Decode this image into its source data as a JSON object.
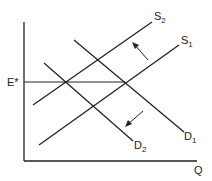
{
  "diagram": {
    "type": "supply-demand",
    "axes": {
      "x_label": "Q",
      "y_label": ""
    },
    "price_marker": {
      "label": "E*",
      "base": "E",
      "sup": "*"
    },
    "curves": [
      {
        "name": "S1",
        "base": "S",
        "sub": "1",
        "x1": 39,
        "y1": 145,
        "x2": 179,
        "y2": 45
      },
      {
        "name": "S2",
        "base": "S",
        "sub": "2",
        "x1": 33,
        "y1": 105,
        "x2": 152,
        "y2": 22
      },
      {
        "name": "D1",
        "base": "D",
        "sub": "1",
        "x1": 74,
        "y1": 40,
        "x2": 184,
        "y2": 132
      },
      {
        "name": "D2",
        "base": "D",
        "sub": "2",
        "x1": 44,
        "y1": 63,
        "x2": 133,
        "y2": 141
      }
    ],
    "arrows": [
      {
        "name": "supply-shift-arrow",
        "direction": "up-left"
      },
      {
        "name": "demand-shift-arrow",
        "direction": "down-left"
      }
    ]
  }
}
